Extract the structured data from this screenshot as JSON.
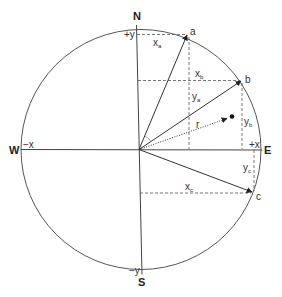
{
  "diagram": {
    "title": "",
    "colors": {
      "line": "#444444",
      "dashed": "#555555",
      "text": "#333333",
      "background": "#ffffff"
    },
    "cardinal_labels": {
      "north": "N",
      "south": "S",
      "east": "E",
      "west": "W"
    },
    "axis_labels": {
      "plus_y": "+y",
      "minus_y": "−y",
      "plus_x": "+x",
      "minus_x": "−x"
    },
    "points": {
      "a": "a",
      "b": "b",
      "c": "c"
    },
    "component_labels": {
      "xa": {
        "base": "x",
        "sub": "a"
      },
      "ya": {
        "base": "y",
        "sub": "a"
      },
      "xb": {
        "base": "x",
        "sub": "b"
      },
      "yb": {
        "base": "y",
        "sub": "b"
      },
      "xc": {
        "base": "x",
        "sub": "c"
      },
      "yc": {
        "base": "y",
        "sub": "c"
      }
    },
    "radius_label": "r",
    "icons": {
      "arrowhead": "arrowhead-icon",
      "dot": "point-dot-icon"
    }
  }
}
